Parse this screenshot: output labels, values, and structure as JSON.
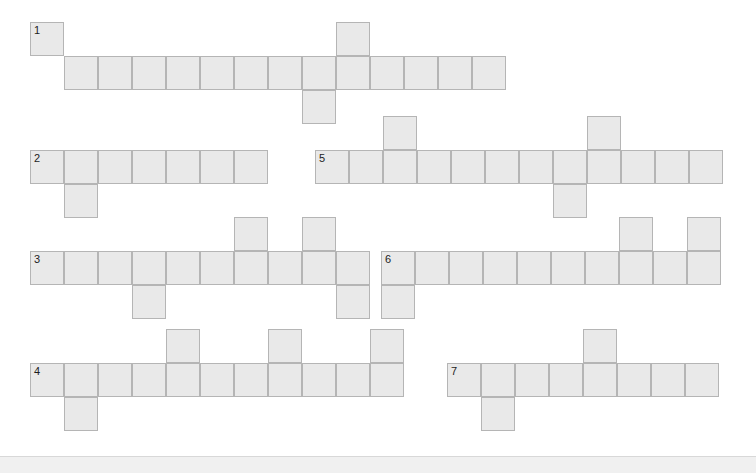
{
  "page": {
    "width": 756,
    "height": 473,
    "background": "#ffffff"
  },
  "grid": {
    "cell_size": 34,
    "cell_fill": "#e9e9e9",
    "cell_border": "#b5b5b5",
    "number_color": "#1d1d1d",
    "entry_count": 7,
    "total_cells": 82
  },
  "bottom_bar": {
    "background": "#f0f0f0",
    "border": "#d8d8d8",
    "height": 17,
    "label": ""
  },
  "entries": [
    {
      "number": "1",
      "orientation": "across",
      "length": 13,
      "origin": {
        "x": 30,
        "y": 22
      },
      "cells": [
        {
          "col": 0,
          "row": 0,
          "number": "1",
          "letter": ""
        },
        {
          "col": 1,
          "row": 1,
          "number": "",
          "letter": ""
        },
        {
          "col": 2,
          "row": 1,
          "number": "",
          "letter": ""
        },
        {
          "col": 3,
          "row": 1,
          "number": "",
          "letter": ""
        },
        {
          "col": 4,
          "row": 1,
          "number": "",
          "letter": ""
        },
        {
          "col": 5,
          "row": 1,
          "number": "",
          "letter": ""
        },
        {
          "col": 6,
          "row": 1,
          "number": "",
          "letter": ""
        },
        {
          "col": 7,
          "row": 1,
          "number": "",
          "letter": ""
        },
        {
          "col": 8,
          "row": 1,
          "number": "",
          "letter": ""
        },
        {
          "col": 8,
          "row": 2,
          "number": "",
          "letter": ""
        },
        {
          "col": 9,
          "row": 0,
          "number": "",
          "letter": ""
        },
        {
          "col": 9,
          "row": 1,
          "number": "",
          "letter": ""
        },
        {
          "col": 10,
          "row": 1,
          "number": "",
          "letter": ""
        },
        {
          "col": 11,
          "row": 1,
          "number": "",
          "letter": ""
        },
        {
          "col": 12,
          "row": 1,
          "number": "",
          "letter": ""
        },
        {
          "col": 13,
          "row": 1,
          "number": "",
          "letter": ""
        }
      ]
    },
    {
      "number": "2",
      "orientation": "across",
      "length": 7,
      "origin": {
        "x": 30,
        "y": 150
      },
      "cells": [
        {
          "col": 0,
          "row": 0,
          "number": "2",
          "letter": ""
        },
        {
          "col": 1,
          "row": 0,
          "number": "",
          "letter": ""
        },
        {
          "col": 1,
          "row": 1,
          "number": "",
          "letter": ""
        },
        {
          "col": 2,
          "row": 0,
          "number": "",
          "letter": ""
        },
        {
          "col": 3,
          "row": 0,
          "number": "",
          "letter": ""
        },
        {
          "col": 4,
          "row": 0,
          "number": "",
          "letter": ""
        },
        {
          "col": 5,
          "row": 0,
          "number": "",
          "letter": ""
        },
        {
          "col": 6,
          "row": 0,
          "number": "",
          "letter": ""
        }
      ]
    },
    {
      "number": "3",
      "orientation": "across",
      "length": 10,
      "origin": {
        "x": 30,
        "y": 251
      },
      "cells": [
        {
          "col": 0,
          "row": 0,
          "number": "3",
          "letter": ""
        },
        {
          "col": 1,
          "row": 0,
          "number": "",
          "letter": ""
        },
        {
          "col": 2,
          "row": 0,
          "number": "",
          "letter": ""
        },
        {
          "col": 3,
          "row": 0,
          "number": "",
          "letter": ""
        },
        {
          "col": 3,
          "row": 1,
          "number": "",
          "letter": ""
        },
        {
          "col": 4,
          "row": 0,
          "number": "",
          "letter": ""
        },
        {
          "col": 5,
          "row": 0,
          "number": "",
          "letter": ""
        },
        {
          "col": 6,
          "row": -1,
          "number": "",
          "letter": ""
        },
        {
          "col": 6,
          "row": 0,
          "number": "",
          "letter": ""
        },
        {
          "col": 7,
          "row": 0,
          "number": "",
          "letter": ""
        },
        {
          "col": 8,
          "row": -1,
          "number": "",
          "letter": ""
        },
        {
          "col": 8,
          "row": 0,
          "number": "",
          "letter": ""
        },
        {
          "col": 9,
          "row": 0,
          "number": "",
          "letter": ""
        },
        {
          "col": 9,
          "row": 1,
          "number": "",
          "letter": ""
        }
      ]
    },
    {
      "number": "4",
      "orientation": "across",
      "length": 11,
      "origin": {
        "x": 30,
        "y": 363
      },
      "cells": [
        {
          "col": 0,
          "row": 0,
          "number": "4",
          "letter": ""
        },
        {
          "col": 1,
          "row": 0,
          "number": "",
          "letter": ""
        },
        {
          "col": 1,
          "row": 1,
          "number": "",
          "letter": ""
        },
        {
          "col": 2,
          "row": 0,
          "number": "",
          "letter": ""
        },
        {
          "col": 3,
          "row": 0,
          "number": "",
          "letter": ""
        },
        {
          "col": 4,
          "row": -1,
          "number": "",
          "letter": ""
        },
        {
          "col": 4,
          "row": 0,
          "number": "",
          "letter": ""
        },
        {
          "col": 5,
          "row": 0,
          "number": "",
          "letter": ""
        },
        {
          "col": 6,
          "row": 0,
          "number": "",
          "letter": ""
        },
        {
          "col": 7,
          "row": -1,
          "number": "",
          "letter": ""
        },
        {
          "col": 7,
          "row": 0,
          "number": "",
          "letter": ""
        },
        {
          "col": 8,
          "row": 0,
          "number": "",
          "letter": ""
        },
        {
          "col": 9,
          "row": 0,
          "number": "",
          "letter": ""
        },
        {
          "col": 10,
          "row": -1,
          "number": "",
          "letter": ""
        },
        {
          "col": 10,
          "row": 0,
          "number": "",
          "letter": ""
        }
      ]
    },
    {
      "number": "5",
      "orientation": "across",
      "length": 11,
      "origin": {
        "x": 315,
        "y": 150
      },
      "cells": [
        {
          "col": 0,
          "row": 0,
          "number": "5",
          "letter": ""
        },
        {
          "col": 1,
          "row": 0,
          "number": "",
          "letter": ""
        },
        {
          "col": 2,
          "row": -1,
          "number": "",
          "letter": ""
        },
        {
          "col": 2,
          "row": 0,
          "number": "",
          "letter": ""
        },
        {
          "col": 3,
          "row": 0,
          "number": "",
          "letter": ""
        },
        {
          "col": 4,
          "row": 0,
          "number": "",
          "letter": ""
        },
        {
          "col": 5,
          "row": 0,
          "number": "",
          "letter": ""
        },
        {
          "col": 6,
          "row": 0,
          "number": "",
          "letter": ""
        },
        {
          "col": 7,
          "row": 0,
          "number": "",
          "letter": ""
        },
        {
          "col": 7,
          "row": 1,
          "number": "",
          "letter": ""
        },
        {
          "col": 8,
          "row": -1,
          "number": "",
          "letter": ""
        },
        {
          "col": 8,
          "row": 0,
          "number": "",
          "letter": ""
        },
        {
          "col": 9,
          "row": 0,
          "number": "",
          "letter": ""
        },
        {
          "col": 10,
          "row": 0,
          "number": "",
          "letter": ""
        },
        {
          "col": 11,
          "row": 0,
          "number": "",
          "letter": ""
        }
      ]
    },
    {
      "number": "6",
      "orientation": "across",
      "length": 10,
      "origin": {
        "x": 381,
        "y": 251
      },
      "cells": [
        {
          "col": 0,
          "row": 0,
          "number": "6",
          "letter": ""
        },
        {
          "col": 0,
          "row": 1,
          "number": "",
          "letter": ""
        },
        {
          "col": 1,
          "row": 0,
          "number": "",
          "letter": ""
        },
        {
          "col": 2,
          "row": 0,
          "number": "",
          "letter": ""
        },
        {
          "col": 3,
          "row": 0,
          "number": "",
          "letter": ""
        },
        {
          "col": 4,
          "row": 0,
          "number": "",
          "letter": ""
        },
        {
          "col": 5,
          "row": 0,
          "number": "",
          "letter": ""
        },
        {
          "col": 6,
          "row": 0,
          "number": "",
          "letter": ""
        },
        {
          "col": 7,
          "row": 0,
          "number": "",
          "letter": ""
        },
        {
          "col": 7,
          "row": -1,
          "number": "",
          "letter": ""
        },
        {
          "col": 8,
          "row": 0,
          "number": "",
          "letter": ""
        },
        {
          "col": 9,
          "row": -1,
          "number": "",
          "letter": ""
        },
        {
          "col": 9,
          "row": 0,
          "number": "",
          "letter": ""
        }
      ]
    },
    {
      "number": "7",
      "orientation": "across",
      "length": 8,
      "origin": {
        "x": 447,
        "y": 363
      },
      "cells": [
        {
          "col": 0,
          "row": 0,
          "number": "7",
          "letter": ""
        },
        {
          "col": 1,
          "row": 0,
          "number": "",
          "letter": ""
        },
        {
          "col": 1,
          "row": 1,
          "number": "",
          "letter": ""
        },
        {
          "col": 2,
          "row": 0,
          "number": "",
          "letter": ""
        },
        {
          "col": 3,
          "row": 0,
          "number": "",
          "letter": ""
        },
        {
          "col": 4,
          "row": -1,
          "number": "",
          "letter": ""
        },
        {
          "col": 4,
          "row": 0,
          "number": "",
          "letter": ""
        },
        {
          "col": 5,
          "row": 0,
          "number": "",
          "letter": ""
        },
        {
          "col": 6,
          "row": 0,
          "number": "",
          "letter": ""
        },
        {
          "col": 7,
          "row": 0,
          "number": "",
          "letter": ""
        }
      ]
    }
  ]
}
